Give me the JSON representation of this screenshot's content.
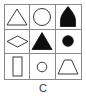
{
  "figure": {
    "label": "C",
    "kind": "3x3-shape-matrix",
    "colors": {
      "stroke": "#3b3b3b",
      "fill_solid": "#0d0d0d",
      "fill_empty": "#ffffff",
      "grid_line": "#8a8a8a",
      "background": "#ffffff"
    },
    "grid": {
      "rows": 3,
      "columns": 3,
      "cells": [
        {
          "row": 1,
          "col": 1,
          "shape": "triangle",
          "fill": "outline",
          "name": "triangle-outline-shape"
        },
        {
          "row": 1,
          "col": 2,
          "shape": "circle",
          "fill": "outline",
          "name": "circle-outline-shape"
        },
        {
          "row": 1,
          "col": 3,
          "shape": "arch",
          "fill": "solid",
          "name": "arch-solid-shape"
        },
        {
          "row": 2,
          "col": 1,
          "shape": "diamond",
          "fill": "outline",
          "name": "diamond-outline-shape"
        },
        {
          "row": 2,
          "col": 2,
          "shape": "triangle",
          "fill": "solid",
          "name": "triangle-solid-shape"
        },
        {
          "row": 2,
          "col": 3,
          "shape": "circle",
          "fill": "solid",
          "name": "circle-solid-shape"
        },
        {
          "row": 3,
          "col": 1,
          "shape": "rectangle",
          "fill": "outline",
          "name": "rectangle-outline-shape"
        },
        {
          "row": 3,
          "col": 2,
          "shape": "circle",
          "fill": "outline",
          "name": "small-circle-outline-shape"
        },
        {
          "row": 3,
          "col": 3,
          "shape": "trapezoid",
          "fill": "outline",
          "name": "trapezoid-outline-shape"
        }
      ]
    }
  }
}
